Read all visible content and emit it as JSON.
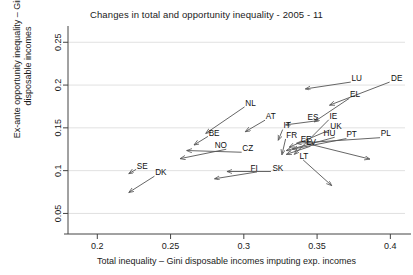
{
  "chart_data": {
    "type": "scatter",
    "title": "Changes in total and opportunity inequality - 2005 - 11",
    "xlabel": "Total inequality – Gini disposable incomes imputing exp. incomes",
    "ylabel_line1": "Ex-ante opportunity inequality – Gini",
    "ylabel_line2": "disposable incomes",
    "xlim": [
      0.18,
      0.41
    ],
    "ylim": [
      0.04,
      0.262
    ],
    "xticks": [
      "0.2",
      "0.25",
      "0.3",
      "0.35",
      "0.4"
    ],
    "xtick_values": [
      0.2,
      0.25,
      0.3,
      0.35,
      0.4
    ],
    "yticks": [
      "0.05",
      "0.1",
      "0.15",
      "0.2",
      "0.25"
    ],
    "ytick_values": [
      0.05,
      0.1,
      0.15,
      0.2,
      0.25
    ],
    "grid": "horizontal",
    "legend": "none",
    "annotation": "Each arrow runs from the 2005 position (label end) to the 2011 position (arrow head).",
    "arrows": [
      {
        "label": "DE",
        "x0": 0.3995,
        "y0": 0.2035,
        "x1": 0.3585,
        "y1": 0.1765,
        "lx": 0.4005,
        "ly": 0.205,
        "anchor": "start"
      },
      {
        "label": "LU",
        "x0": 0.373,
        "y0": 0.2035,
        "x1": 0.342,
        "y1": 0.1955,
        "lx": 0.3735,
        "ly": 0.205,
        "anchor": "start"
      },
      {
        "label": "EL",
        "x0": 0.372,
        "y0": 0.1845,
        "x1": 0.348,
        "y1": 0.157,
        "lx": 0.3725,
        "ly": 0.186,
        "anchor": "start"
      },
      {
        "label": "IE",
        "x0": 0.358,
        "y0": 0.1595,
        "x1": 0.3345,
        "y1": 0.119,
        "lx": 0.3585,
        "ly": 0.1605,
        "anchor": "start"
      },
      {
        "label": "ES",
        "x0": 0.351,
        "y0": 0.1585,
        "x1": 0.3285,
        "y1": 0.1535,
        "lx": 0.351,
        "ly": 0.1595,
        "anchor": "end"
      },
      {
        "label": "UK",
        "x0": 0.3585,
        "y0": 0.1475,
        "x1": 0.331,
        "y1": 0.1275,
        "lx": 0.359,
        "ly": 0.1485,
        "anchor": "start"
      },
      {
        "label": "PL",
        "x0": 0.393,
        "y0": 0.1385,
        "x1": 0.336,
        "y1": 0.132,
        "lx": 0.3935,
        "ly": 0.14,
        "anchor": "start"
      },
      {
        "label": "PT",
        "x0": 0.37,
        "y0": 0.1375,
        "x1": 0.333,
        "y1": 0.125,
        "lx": 0.37,
        "ly": 0.139,
        "anchor": "start"
      },
      {
        "label": "HU",
        "x0": 0.362,
        "y0": 0.139,
        "x1": 0.329,
        "y1": 0.1235,
        "lx": 0.3625,
        "ly": 0.1405,
        "anchor": "end"
      },
      {
        "label": "EE",
        "x0": 0.3425,
        "y0": 0.132,
        "x1": 0.386,
        "y1": 0.1135,
        "lx": 0.3425,
        "ly": 0.133,
        "anchor": "middle"
      },
      {
        "label": "LV",
        "x0": 0.3455,
        "y0": 0.1285,
        "x1": 0.329,
        "y1": 0.119,
        "lx": 0.346,
        "ly": 0.1295,
        "anchor": "middle"
      },
      {
        "label": "LT",
        "x0": 0.3405,
        "y0": 0.1125,
        "x1": 0.36,
        "y1": 0.0825,
        "lx": 0.341,
        "ly": 0.114,
        "anchor": "middle"
      },
      {
        "label": "SK",
        "x0": 0.3185,
        "y0": 0.099,
        "x1": 0.2885,
        "y1": 0.099,
        "lx": 0.3195,
        "ly": 0.1,
        "anchor": "start"
      },
      {
        "label": "FI",
        "x0": 0.309,
        "y0": 0.0985,
        "x1": 0.28,
        "y1": 0.0905,
        "lx": 0.3095,
        "ly": 0.0998,
        "anchor": "end"
      },
      {
        "label": "FR",
        "x0": 0.3285,
        "y0": 0.137,
        "x1": 0.326,
        "y1": 0.1185,
        "lx": 0.329,
        "ly": 0.1385,
        "anchor": "start"
      },
      {
        "label": "IT",
        "x0": 0.3265,
        "y0": 0.148,
        "x1": 0.3235,
        "y1": 0.1355,
        "lx": 0.327,
        "ly": 0.1495,
        "anchor": "start"
      },
      {
        "label": "AT",
        "x0": 0.3145,
        "y0": 0.159,
        "x1": 0.301,
        "y1": 0.1455,
        "lx": 0.315,
        "ly": 0.16,
        "anchor": "start"
      },
      {
        "label": "NL",
        "x0": 0.3005,
        "y0": 0.1745,
        "x1": 0.274,
        "y1": 0.1435,
        "lx": 0.301,
        "ly": 0.176,
        "anchor": "start"
      },
      {
        "label": "BE",
        "x0": 0.2755,
        "y0": 0.14,
        "x1": 0.266,
        "y1": 0.13,
        "lx": 0.276,
        "ly": 0.1405,
        "anchor": "start"
      },
      {
        "label": "CZ",
        "x0": 0.2985,
        "y0": 0.1215,
        "x1": 0.261,
        "y1": 0.1235,
        "lx": 0.299,
        "ly": 0.1225,
        "anchor": "start"
      },
      {
        "label": "NO",
        "x0": 0.288,
        "y0": 0.125,
        "x1": 0.2565,
        "y1": 0.114,
        "lx": 0.2885,
        "ly": 0.1262,
        "anchor": "end"
      },
      {
        "label": "SE",
        "x0": 0.2265,
        "y0": 0.1015,
        "x1": 0.2215,
        "y1": 0.0965,
        "lx": 0.227,
        "ly": 0.1025,
        "anchor": "start"
      },
      {
        "label": "DK",
        "x0": 0.239,
        "y0": 0.0935,
        "x1": 0.2215,
        "y1": 0.0745,
        "lx": 0.2395,
        "ly": 0.0945,
        "anchor": "start"
      }
    ]
  }
}
